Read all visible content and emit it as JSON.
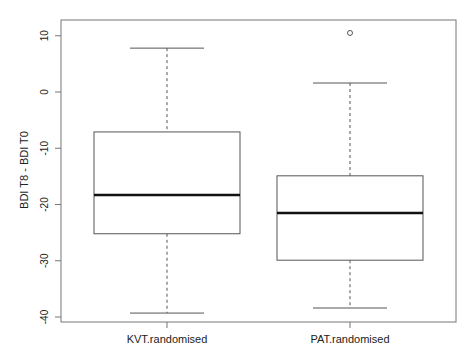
{
  "chart_data": {
    "type": "boxplot",
    "title": "",
    "xlabel": "",
    "ylabel": "BDI T8 - BDI T0",
    "categories": [
      "KVT.randomised",
      "PAT.randomised"
    ],
    "boxes": [
      {
        "name": "KVT.randomised",
        "whisker_low": -39.3,
        "q1": -25.2,
        "median": -18.3,
        "q3": -7.1,
        "whisker_high": 7.8,
        "outliers": []
      },
      {
        "name": "PAT.randomised",
        "whisker_low": -38.4,
        "q1": -29.9,
        "median": -21.5,
        "q3": -14.9,
        "whisker_high": 1.6,
        "outliers": [
          10.5
        ]
      }
    ],
    "yticks": [
      10,
      0,
      -10,
      -20,
      -30,
      -40
    ],
    "ytick_labels": [
      "10",
      "0",
      "-10",
      "-20",
      "-30",
      "-40"
    ],
    "ylim": [
      -41,
      12.8
    ],
    "grid": false,
    "legend": null
  }
}
